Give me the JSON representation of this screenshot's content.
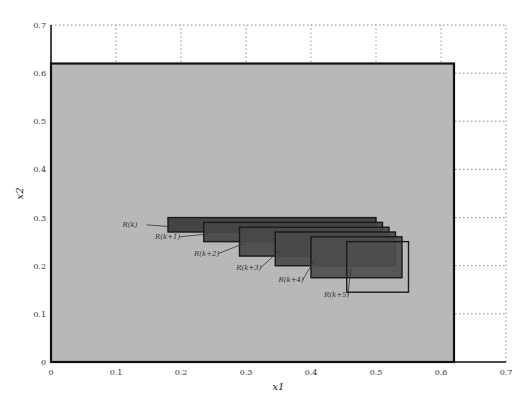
{
  "chart_data": {
    "type": "area",
    "title": "",
    "xlabel": "x1",
    "ylabel": "x2",
    "xlim": [
      0,
      0.7
    ],
    "ylim": [
      0,
      0.7
    ],
    "grid": true,
    "grid_style": "dotted",
    "x_ticks": [
      "0",
      "0.1",
      "0.2",
      "0.3",
      "0.4",
      "0.5",
      "0.6",
      "0.7"
    ],
    "y_ticks": [
      "0",
      "0.1",
      "0.2",
      "0.3",
      "0.4",
      "0.5",
      "0.6",
      "0.7"
    ],
    "background_region": {
      "x0": 0,
      "x1": 0.62,
      "y0": 0,
      "y1": 0.62,
      "color": "#b8b8b8"
    },
    "regions": [
      {
        "name": "R(k)",
        "label": "R(k)",
        "x0": 0.18,
        "x1": 0.5,
        "y0": 0.27,
        "y1": 0.3,
        "fill": "#3a3a3a",
        "label_x": 0.11,
        "label_y": 0.285
      },
      {
        "name": "R(k+1)",
        "label": "R(k+1)",
        "x0": 0.235,
        "x1": 0.51,
        "y0": 0.25,
        "y1": 0.29,
        "fill": "#454545",
        "label_x": 0.16,
        "label_y": 0.26
      },
      {
        "name": "R(k+2)",
        "label": "R(k+2)",
        "x0": 0.29,
        "x1": 0.52,
        "y0": 0.22,
        "y1": 0.28,
        "fill": "#484848",
        "label_x": 0.22,
        "label_y": 0.225
      },
      {
        "name": "R(k+3)",
        "label": "R(k+3)",
        "x0": 0.345,
        "x1": 0.53,
        "y0": 0.2,
        "y1": 0.27,
        "fill": "#4a4a4a",
        "label_x": 0.285,
        "label_y": 0.195
      },
      {
        "name": "R(k+4)",
        "label": "R(k+4)",
        "x0": 0.4,
        "x1": 0.54,
        "y0": 0.175,
        "y1": 0.26,
        "fill": "#4d4d4d",
        "label_x": 0.35,
        "label_y": 0.17
      },
      {
        "name": "R(k+5)",
        "label": "R(k+5)",
        "x0": 0.455,
        "x1": 0.55,
        "y0": 0.145,
        "y1": 0.25,
        "fill": "none",
        "label_x": 0.42,
        "label_y": 0.14
      }
    ],
    "legend": null
  }
}
